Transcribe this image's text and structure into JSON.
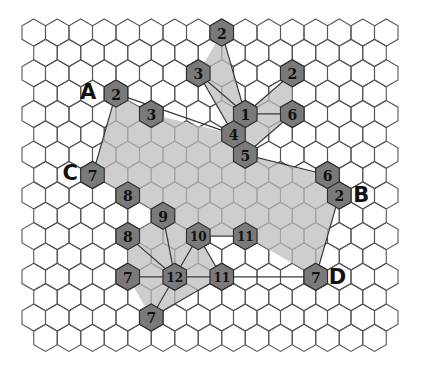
{
  "diagram": {
    "colors": {
      "grid_line": "#555555",
      "region_fill": "#bdbdbd",
      "marked_hex_fill": "#7a7a7a",
      "text": "#111111"
    },
    "corner_labels": [
      {
        "id": "A",
        "text": "A",
        "attached_to": "n-a"
      },
      {
        "id": "B",
        "text": "B",
        "attached_to": "n-b"
      },
      {
        "id": "C",
        "text": "C",
        "attached_to": "n-c"
      },
      {
        "id": "D",
        "text": "D",
        "attached_to": "n-d"
      }
    ],
    "nodes": [
      {
        "id": "n-a",
        "value": "2"
      },
      {
        "id": "n-3a",
        "value": "3"
      },
      {
        "id": "n-2top",
        "value": "2"
      },
      {
        "id": "n-3b",
        "value": "3"
      },
      {
        "id": "n-2r",
        "value": "2"
      },
      {
        "id": "n-1",
        "value": "1"
      },
      {
        "id": "n-6a",
        "value": "6"
      },
      {
        "id": "n-4",
        "value": "4"
      },
      {
        "id": "n-5",
        "value": "5"
      },
      {
        "id": "n-6b",
        "value": "6"
      },
      {
        "id": "n-b",
        "value": "2"
      },
      {
        "id": "n-c",
        "value": "7"
      },
      {
        "id": "n-8a",
        "value": "8"
      },
      {
        "id": "n-9",
        "value": "9"
      },
      {
        "id": "n-8b",
        "value": "8"
      },
      {
        "id": "n-10",
        "value": "10"
      },
      {
        "id": "n-11a",
        "value": "11"
      },
      {
        "id": "n-7a",
        "value": "7"
      },
      {
        "id": "n-12",
        "value": "12"
      },
      {
        "id": "n-11b",
        "value": "11"
      },
      {
        "id": "n-d",
        "value": "7"
      },
      {
        "id": "n-7b",
        "value": "7"
      }
    ],
    "links": [
      [
        "n-a",
        "n-c"
      ],
      [
        "n-a",
        "n-4"
      ],
      [
        "n-3b",
        "n-1"
      ],
      [
        "n-3b",
        "n-4"
      ],
      [
        "n-2top",
        "n-1"
      ],
      [
        "n-2r",
        "n-1"
      ],
      [
        "n-1",
        "n-6a"
      ],
      [
        "n-6a",
        "n-5"
      ],
      [
        "n-5",
        "n-6b"
      ],
      [
        "n-b",
        "n-d"
      ],
      [
        "n-11b",
        "n-d"
      ],
      [
        "n-10",
        "n-11a"
      ],
      [
        "n-9",
        "n-12"
      ],
      [
        "n-8b",
        "n-12"
      ],
      [
        "n-7a",
        "n-12"
      ],
      [
        "n-12",
        "n-11b"
      ],
      [
        "n-10",
        "n-12"
      ],
      [
        "n-10",
        "n-11b"
      ],
      [
        "n-12",
        "n-7b"
      ],
      [
        "n-11b",
        "n-7b"
      ]
    ]
  }
}
